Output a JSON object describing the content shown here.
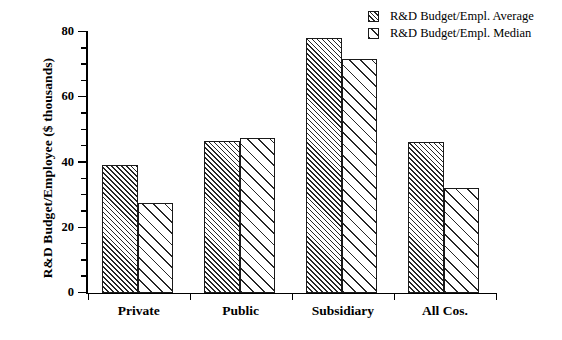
{
  "chart_data": {
    "type": "bar",
    "title": "",
    "xlabel": "",
    "ylabel": "R&D Budget/Employee ($ thousands)",
    "ylim": [
      0,
      80
    ],
    "yticks": [
      0,
      20,
      40,
      60,
      80
    ],
    "ytick_labels": [
      "0",
      "20",
      "40",
      "60",
      "80"
    ],
    "minor_tick_interval": 5,
    "grid": false,
    "legend_position": "top-right",
    "categories": [
      "Private",
      "Public",
      "Subsidiary",
      "All Cos."
    ],
    "series": [
      {
        "name": "R&D Budget/Empl. Average",
        "pattern": "dense-diagonal-hatch",
        "values": [
          39,
          46.5,
          78,
          46
        ]
      },
      {
        "name": "R&D Budget/Empl. Median",
        "pattern": "sparse-diagonal-hatch",
        "values": [
          27.5,
          47.5,
          71.5,
          32
        ]
      }
    ]
  },
  "legend": {
    "items": [
      {
        "label": "R&D Budget/Empl. Average",
        "swatch": "dense-hatch-swatch"
      },
      {
        "label": "R&D Budget/Empl. Median",
        "swatch": "sparse-hatch-swatch"
      }
    ]
  },
  "colors": {
    "axis": "#000000",
    "bar_outline": "#1a1a1a",
    "hatch": "#262626",
    "background": "#ffffff"
  }
}
